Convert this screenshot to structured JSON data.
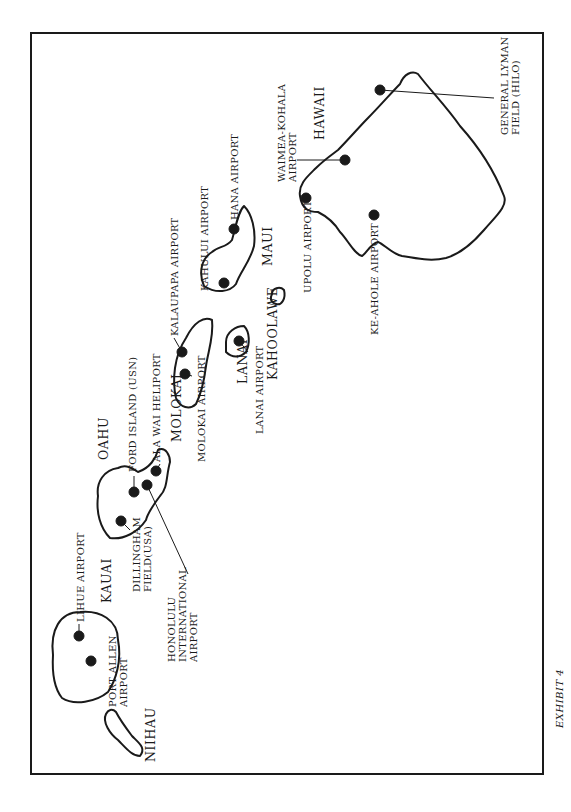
{
  "document": {
    "caption": "EXHIBIT 4",
    "orientation": "rotated 90° counter-clockwise"
  },
  "islands": {
    "niihau": "NIIHAU",
    "kauai": "KAUAI",
    "oahu": "OAHU",
    "molokai": "MOLOKAI",
    "lanai": "LANAI",
    "kahoolawe": "KAHOOLAWE",
    "maui": "MAUI",
    "hawaii": "HAWAII"
  },
  "airports": {
    "lihue": "LIHUE AIRPORT",
    "port_allen_1": "PORT ALLEN",
    "port_allen_2": "AIRPORT",
    "dillingham_1": "DILLINGHAM",
    "dillingham_2": "FIELD(USA)",
    "honolulu_1": "HONOLULU",
    "honolulu_2": "INTERNATIONAL",
    "honolulu_3": "AIRPORT",
    "ford_island": "FORD ISLAND (USN)",
    "ala_wai": "ALA WAI HELIPORT",
    "molokai": "MOLOKAI AIRPORT",
    "kalaupapa": "KALAUPAPA AIRPORT",
    "lanai": "LANAI AIRPORT",
    "kahului": "KAHULUI AIRPORT",
    "hana": "HANA AIRPORT",
    "upolu": "UPOLU AIRPORT",
    "waimea_1": "WAIMEA-KOHALA",
    "waimea_2": "AIRPORT",
    "keahole": "KE-AHOLE AIRPORT",
    "hilo_1": "GENERAL LYMAN",
    "hilo_2": "FIELD (HILO)"
  },
  "colors": {
    "ink": "#1a1a1a",
    "paper": "#ffffff"
  }
}
